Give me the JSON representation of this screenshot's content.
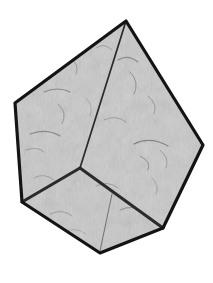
{
  "canvas": {
    "width": 213,
    "height": 283,
    "background_color": "#ffffff"
  },
  "figure": {
    "name": "faceted-stone-polyhedron",
    "outline_color": "#141414",
    "outline_width": 3.2,
    "interior_edge_color": "#2a2a2a",
    "interior_edge_width": 1.6,
    "hairline_color": "#555555",
    "hairline_width": 0.9,
    "fill_base_color": "#c2c2c2",
    "fill_light_color": "#d6d6d6",
    "fill_dark_color": "#9a9a9a",
    "speckle_color": "#6e6e6e",
    "streak_color": "#4a4a4a",
    "vertices": {
      "apex": [
        126,
        21
      ],
      "left": [
        15,
        103
      ],
      "right": [
        203,
        145
      ],
      "lower_left": [
        22,
        202
      ],
      "bottom": [
        100,
        253
      ],
      "bottom_right": [
        163,
        228
      ],
      "center_junction": [
        80,
        168
      ]
    },
    "outline_path": "M126,21 L203,145 L163,228 L100,253 L22,202 L15,103 Z",
    "facets": [
      {
        "name": "facet-left-upper",
        "path": "M126,21 L80,168 L22,202 L15,103 Z",
        "tone": "#c4c4c4"
      },
      {
        "name": "facet-right-upper",
        "path": "M126,21 L203,145 L163,228 L80,168 Z",
        "tone": "#cacaca"
      },
      {
        "name": "facet-bottom",
        "path": "M80,168 L163,228 L100,253 L22,202 Z",
        "tone": "#bfbfbf"
      }
    ],
    "interior_edges": [
      {
        "name": "edge-apex-to-center",
        "path": "M126,21 L80,168"
      },
      {
        "name": "edge-center-to-lower-left",
        "path": "M80,168 L22,202"
      },
      {
        "name": "edge-center-to-bottom-right",
        "path": "M80,168 L163,228"
      }
    ],
    "hairlines": [
      {
        "name": "hairline-bottom-facet-crease",
        "path": "M112,194 L100,251"
      }
    ]
  }
}
